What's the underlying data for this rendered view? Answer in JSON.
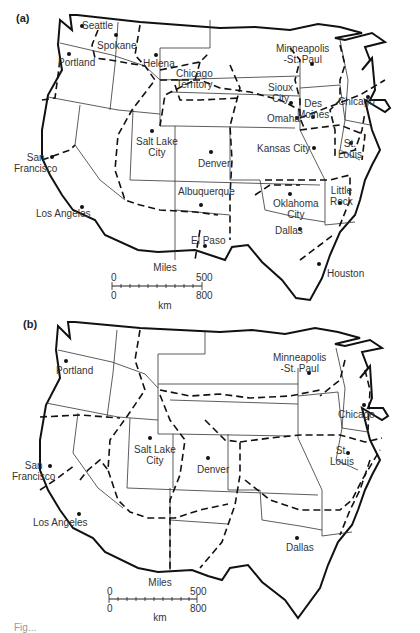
{
  "figure": {
    "caption_fragment": "Fig..."
  },
  "panels": [
    {
      "label": "(a)",
      "cities": [
        {
          "name": "Seattle",
          "x": 82,
          "y": 26,
          "lx": 82,
          "ly": 20
        },
        {
          "name": "Spokane",
          "x": 116,
          "y": 35,
          "lx": 97,
          "ly": 40
        },
        {
          "name": "Portland",
          "x": 69,
          "y": 54,
          "lx": 58,
          "ly": 57
        },
        {
          "name": "Helena",
          "x": 156,
          "y": 55,
          "lx": 143,
          "ly": 58
        },
        {
          "name": "Chicago\nTerritory",
          "x": 0,
          "y": 0,
          "lx": 176,
          "ly": 68,
          "nodot": true
        },
        {
          "name": "Minneapolis\n-St. Paul",
          "x": 312,
          "y": 64,
          "lx": 276,
          "ly": 43
        },
        {
          "name": "Sioux\nCity",
          "x": 291,
          "y": 103,
          "lx": 268,
          "ly": 82
        },
        {
          "name": "Des\nMoines",
          "x": 313,
          "y": 117,
          "lx": 297,
          "ly": 98
        },
        {
          "name": "Omaha",
          "x": 297,
          "y": 118,
          "lx": 267,
          "ly": 113
        },
        {
          "name": "Chicago",
          "x": 368,
          "y": 97,
          "lx": 338,
          "ly": 96
        },
        {
          "name": "Salt Lake\nCity",
          "x": 152,
          "y": 131,
          "lx": 136,
          "ly": 136
        },
        {
          "name": "Denver",
          "x": 211,
          "y": 152,
          "lx": 198,
          "ly": 158
        },
        {
          "name": "Kansas City",
          "x": 314,
          "y": 148,
          "lx": 257,
          "ly": 143
        },
        {
          "name": "St.\nLouis",
          "x": 351,
          "y": 143,
          "lx": 338,
          "ly": 138
        },
        {
          "name": "San\nFrancisco",
          "x": 52,
          "y": 157,
          "lx": 14,
          "ly": 152
        },
        {
          "name": "Los Angeles",
          "x": 82,
          "y": 207,
          "lx": 36,
          "ly": 208
        },
        {
          "name": "Albuquerque",
          "x": 201,
          "y": 205,
          "lx": 178,
          "ly": 186
        },
        {
          "name": "Oklahoma\nCity",
          "x": 290,
          "y": 194,
          "lx": 273,
          "ly": 198
        },
        {
          "name": "Little\nRock",
          "x": 340,
          "y": 203,
          "lx": 330,
          "ly": 185
        },
        {
          "name": "El Paso",
          "x": 205,
          "y": 246,
          "lx": 191,
          "ly": 235
        },
        {
          "name": "Dallas",
          "x": 300,
          "y": 229,
          "lx": 275,
          "ly": 225
        },
        {
          "name": "Houston",
          "x": 319,
          "y": 264,
          "lx": 327,
          "ly": 268
        }
      ],
      "scale": {
        "title": "Miles",
        "miles_min": "0",
        "miles_max": "500",
        "km_min": "0",
        "km_max": "800",
        "unit_km": "km"
      }
    },
    {
      "label": "(b)",
      "cities": [
        {
          "name": "Portland",
          "x": 66,
          "y": 61,
          "lx": 56,
          "ly": 65
        },
        {
          "name": "Minneapolis\n-St. Paul",
          "x": 309,
          "y": 73,
          "lx": 273,
          "ly": 52
        },
        {
          "name": "Chicago",
          "x": 364,
          "y": 105,
          "lx": 338,
          "ly": 109
        },
        {
          "name": "Salt Lake\nCity",
          "x": 150,
          "y": 138,
          "lx": 134,
          "ly": 144
        },
        {
          "name": "Denver",
          "x": 208,
          "y": 158,
          "lx": 197,
          "ly": 164
        },
        {
          "name": "St.\nLouis",
          "x": 348,
          "y": 153,
          "lx": 330,
          "ly": 145
        },
        {
          "name": "San\nFrancisco",
          "x": 50,
          "y": 166,
          "lx": 12,
          "ly": 160
        },
        {
          "name": "Los Angeles",
          "x": 79,
          "y": 214,
          "lx": 33,
          "ly": 217
        },
        {
          "name": "Dallas",
          "x": 297,
          "y": 238,
          "lx": 286,
          "ly": 242
        }
      ],
      "scale": {
        "title": "Miles",
        "miles_min": "0",
        "miles_max": "500",
        "km_min": "0",
        "km_max": "800",
        "unit_km": "km"
      }
    }
  ]
}
